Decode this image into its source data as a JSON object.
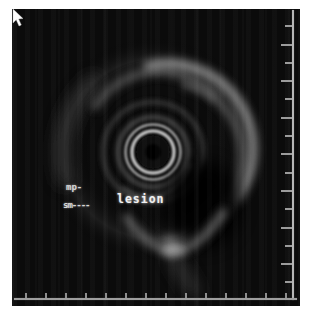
{
  "window": {
    "background": "#ffffff",
    "scan_background": "#0b0b0b"
  },
  "scan": {
    "description": "grayscale endoscopic ultrasound cross-section with concentric wall layers and hypoechoic lesion"
  },
  "labels": {
    "mp": "mp-",
    "sm": "sm----",
    "lesion": "lesion"
  },
  "colors": {
    "label_text": "#d6d6d6",
    "lesion_label_text": "#f0f0f0",
    "ruler": "#9e9e9e",
    "bright_ring": "#c2c2c2",
    "echo_rim": "#909090",
    "cursor": "#ffffff"
  },
  "cursor": {
    "icon": "arrow-pointer"
  },
  "rulers": {
    "right": {
      "orientation": "vertical"
    },
    "bottom": {
      "orientation": "horizontal"
    }
  }
}
